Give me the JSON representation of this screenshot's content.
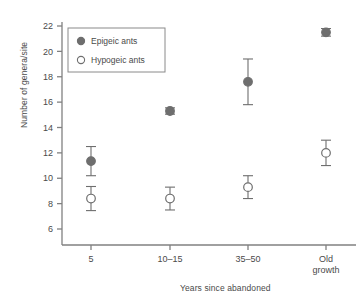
{
  "chart_data": {
    "type": "scatter",
    "title": "",
    "xlabel": "Years since abandoned",
    "ylabel": "Number of genera/site",
    "categories": [
      "5",
      "10–15",
      "35–50",
      "Old growth"
    ],
    "ylim": [
      5,
      22.8
    ],
    "yticks": [
      6,
      8,
      10,
      12,
      14,
      16,
      18,
      20,
      22
    ],
    "grid": false,
    "legend_position": "top-left",
    "series": [
      {
        "name": "Epigeic ants",
        "marker": "filled-circle",
        "color": "#6e6e6e",
        "values": [
          11.35,
          15.3,
          17.6,
          21.5
        ],
        "errors": [
          1.15,
          0.25,
          1.8,
          0.3
        ]
      },
      {
        "name": "Hypogeic ants",
        "marker": "open-circle",
        "color": "#6e6e6e",
        "values": [
          8.4,
          8.4,
          9.3,
          12.0
        ],
        "errors": [
          0.95,
          0.9,
          0.9,
          1.0
        ]
      }
    ]
  },
  "legend": {
    "entries": [
      {
        "label": "Epigeic ants",
        "marker": "filled-circle"
      },
      {
        "label": "Hypogeic ants",
        "marker": "open-circle"
      }
    ]
  },
  "colors": {
    "axis": "#808080",
    "marker_fill": "#6e6e6e",
    "marker_stroke": "#6e6e6e",
    "text": "#4a4a4a",
    "legend_border": "#8a8a8a"
  }
}
